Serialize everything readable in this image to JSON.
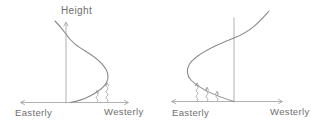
{
  "colors": {
    "curve": "#8b8b8b",
    "axis": "#a8a8a8",
    "hatch": "#999999",
    "text": "#6e6e6e",
    "background": "#ffffff"
  },
  "left_plot": {
    "y_axis_label": "Height",
    "x_left_label": "Easterly",
    "x_right_label": "Westerly"
  },
  "right_plot": {
    "x_left_label": "Easterly",
    "x_right_label": "Westerly"
  }
}
